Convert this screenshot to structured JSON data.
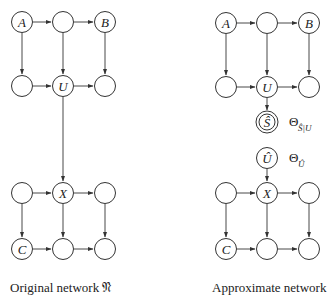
{
  "left_network": {
    "caption": "Original network 𝔑",
    "nodes": {
      "top_left": "A",
      "top_mid": "",
      "top_right": "B",
      "mid_left": "",
      "mid_center": "U",
      "mid_right": "",
      "low_left": "",
      "low_center": "X",
      "low_right": "",
      "bot_left": "C",
      "bot_mid": "",
      "bot_right": ""
    }
  },
  "right_network": {
    "caption": "Approximate network",
    "nodes": {
      "top_left": "A",
      "top_mid": "",
      "top_right": "B",
      "mid_left": "",
      "mid_center": "U",
      "mid_right": "",
      "s_hat": "Ŝ",
      "u_hat": "Û",
      "low_left": "",
      "low_center": "X",
      "low_right": "",
      "bot_left": "C",
      "bot_mid": "",
      "bot_right": ""
    },
    "params": {
      "theta_s_symbol": "Θ",
      "theta_s_subscript": "Ŝ|U",
      "theta_u_symbol": "Θ",
      "theta_u_subscript": "Û"
    }
  }
}
